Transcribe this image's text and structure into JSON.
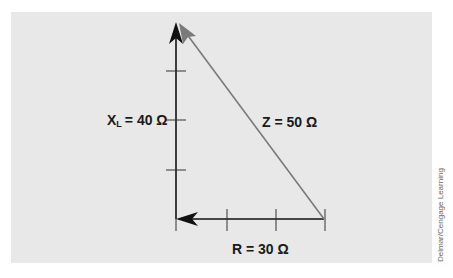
{
  "diagram": {
    "labels": {
      "xl_main": "X",
      "xl_sub": "L",
      "xl_value": "= 40 Ω",
      "z": "Z = 50 Ω",
      "r": "R = 30 Ω"
    },
    "vectors": [
      {
        "name": "XL",
        "value_ohms": 40,
        "direction": "up",
        "color": "#111111"
      },
      {
        "name": "R",
        "value_ohms": 30,
        "direction": "left",
        "color": "#111111"
      },
      {
        "name": "Z",
        "value_ohms": 50,
        "direction": "up-left",
        "color": "#7a7a7a"
      }
    ],
    "xl_ticks": 3,
    "r_ticks": 3
  },
  "credit": "Delmar/Cengage Learning",
  "colors": {
    "background": "#e8e8e8",
    "axis": "#111111",
    "hypotenuse": "#7a7a7a"
  }
}
